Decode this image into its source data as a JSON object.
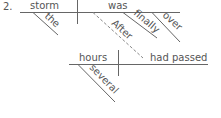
{
  "diagram": {
    "number": "2.",
    "main_clause": {
      "subject": "storm",
      "verb": "was",
      "modifiers": {
        "subject": [
          "the"
        ],
        "verb": [
          "finally",
          "over"
        ]
      }
    },
    "subordinate_clause": {
      "connector": "After",
      "subject": "hours",
      "verb": "had passed",
      "modifiers": {
        "subject": [
          "several"
        ]
      }
    }
  }
}
